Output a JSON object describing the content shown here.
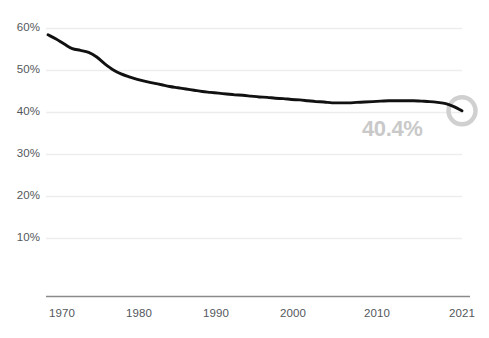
{
  "chart_data": {
    "type": "line",
    "title": "",
    "subtitle": "",
    "xlabel": "",
    "ylabel": "",
    "grid": true,
    "legend": null,
    "xlim": [
      1970,
      2021
    ],
    "ylim": [
      0,
      62
    ],
    "ytick_values": [
      10,
      20,
      30,
      40,
      50,
      60
    ],
    "ytick_labels": [
      "10%",
      "20%",
      "30%",
      "40%",
      "50%",
      "60%"
    ],
    "xtick_values": [
      1970,
      1980,
      1990,
      2000,
      2010,
      2021
    ],
    "xtick_labels": [
      "1970",
      "1980",
      "1990",
      "2000",
      "2010",
      "2021"
    ],
    "series": [
      {
        "name": "share",
        "color": "#111111",
        "x": [
          1970,
          1971,
          1972,
          1973,
          1974,
          1975,
          1976,
          1977,
          1978,
          1979,
          1980,
          1981,
          1982,
          1983,
          1984,
          1985,
          1986,
          1987,
          1988,
          1989,
          1990,
          1991,
          1992,
          1993,
          1994,
          1995,
          1996,
          1997,
          1998,
          1999,
          2000,
          2001,
          2002,
          2003,
          2004,
          2005,
          2006,
          2007,
          2008,
          2009,
          2010,
          2011,
          2012,
          2013,
          2014,
          2015,
          2016,
          2017,
          2018,
          2019,
          2020,
          2021
        ],
        "values": [
          58.5,
          57.5,
          56.3,
          55.2,
          54.8,
          54.3,
          53.2,
          51.6,
          50.2,
          49.2,
          48.5,
          47.9,
          47.4,
          47.0,
          46.6,
          46.2,
          45.9,
          45.6,
          45.3,
          45.0,
          44.8,
          44.6,
          44.4,
          44.2,
          44.1,
          43.9,
          43.7,
          43.6,
          43.4,
          43.3,
          43.1,
          43.0,
          42.8,
          42.6,
          42.5,
          42.3,
          42.3,
          42.3,
          42.4,
          42.5,
          42.6,
          42.7,
          42.8,
          42.8,
          42.8,
          42.8,
          42.7,
          42.6,
          42.4,
          42.1,
          41.4,
          40.4
        ]
      }
    ],
    "end_marker": {
      "year": 2021,
      "value": 40.4,
      "label": "40.4%",
      "label_color": "#c9c9c9",
      "ring_color": "#d0d0d0",
      "shape": "ring"
    },
    "colors": {
      "line": "#111111",
      "grid": "#eeeeee",
      "axis": "#888888",
      "tick_text": "#53575b"
    }
  }
}
